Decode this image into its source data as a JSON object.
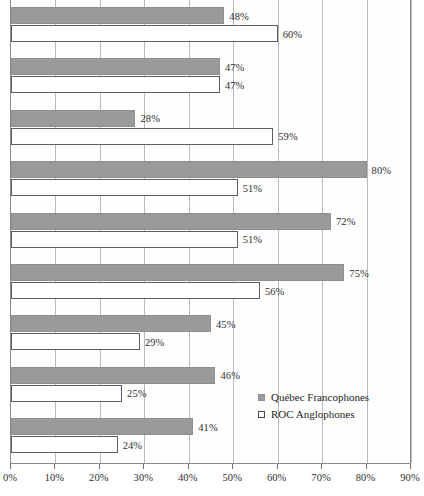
{
  "chart_data": {
    "type": "bar",
    "orientation": "horizontal",
    "title": "",
    "subtitle": "",
    "xlabel": "",
    "ylabel": "",
    "xlim": [
      0,
      90
    ],
    "x_tick_labels": [
      "0%",
      "10%",
      "20%",
      "30%",
      "40%",
      "50%",
      "60%",
      "70%",
      "80%",
      "90%"
    ],
    "x_ticks": [
      0,
      10,
      20,
      30,
      40,
      50,
      60,
      70,
      80,
      90
    ],
    "grid": true,
    "grid_axis": "x",
    "legend_position": "bottom-right",
    "value_suffix": "%",
    "categories": [
      "Group 1",
      "Group 2",
      "Group 3",
      "Group 4",
      "Group 5",
      "Group 6",
      "Group 7",
      "Group 8",
      "Group 9"
    ],
    "series": [
      {
        "name": "Québec Francophones",
        "color": "#9a9a9a",
        "style": "filled",
        "values": [
          48,
          47,
          28,
          80,
          72,
          75,
          45,
          46,
          41
        ],
        "labels": [
          "48%",
          "47%",
          "28%",
          "80%",
          "72%",
          "75%",
          "45%",
          "46%",
          "41%"
        ]
      },
      {
        "name": "ROC Anglophones",
        "color": "#ffffff",
        "style": "hollow",
        "values": [
          60,
          47,
          59,
          51,
          51,
          56,
          29,
          25,
          24
        ],
        "labels": [
          "60%",
          "47%",
          "59%",
          "51%",
          "51%",
          "56%",
          "29%",
          "25%",
          "24%"
        ]
      }
    ]
  },
  "legend": {
    "items": [
      {
        "label": "Québec Francophones",
        "swatch": "filled"
      },
      {
        "label": "ROC Anglophones",
        "swatch": "hollow"
      }
    ]
  },
  "colors": {
    "series_a": "#9a9a9a",
    "series_b": "#ffffff",
    "axis": "#8a8a8a",
    "grid": "#b9b9b9",
    "text": "#2b2b2b"
  }
}
